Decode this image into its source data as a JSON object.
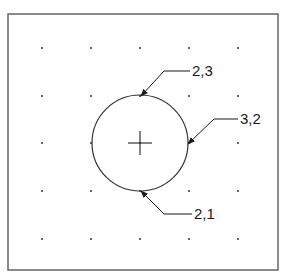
{
  "diagram": {
    "frame": {
      "x": 8,
      "y": 14,
      "width": 270,
      "height": 256,
      "stroke": "#666666"
    },
    "grid": {
      "xs": [
        42,
        91,
        140,
        189,
        238
      ],
      "ys": [
        48,
        96,
        143,
        191,
        239
      ],
      "dot_color": "#333333"
    },
    "circle": {
      "cx": 140,
      "cy": 143,
      "r": 48,
      "stroke": "#333333"
    },
    "center_mark": {
      "cx": 140,
      "cy": 143,
      "arm": 12
    },
    "callouts": [
      {
        "label": "2,3",
        "point": [
          141,
          96
        ],
        "elbow": [
          164,
          71
        ],
        "end": [
          190,
          71
        ]
      },
      {
        "label": "3,2",
        "point": [
          188,
          144
        ],
        "elbow": [
          214,
          119
        ],
        "end": [
          238,
          119
        ]
      },
      {
        "label": "2,1",
        "point": [
          141,
          191
        ],
        "elbow": [
          164,
          214
        ],
        "end": [
          192,
          214
        ]
      }
    ]
  }
}
